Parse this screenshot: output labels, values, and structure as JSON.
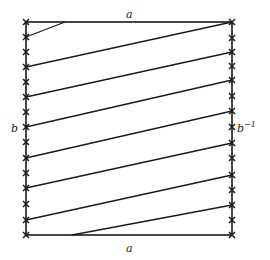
{
  "figure": {
    "labels": {
      "top": "a",
      "bottom": "a",
      "left": "b",
      "right": "b",
      "right_exponent": "−1"
    },
    "square": {
      "x0": 26,
      "y0": 22,
      "x1": 232,
      "y1": 235
    },
    "left_markers_y": [
      22,
      37,
      52,
      67,
      82,
      97,
      112,
      127,
      142,
      158,
      173,
      188,
      204,
      220,
      235
    ],
    "right_markers_y": [
      22,
      38,
      52,
      66,
      80,
      96,
      111,
      127,
      143,
      158,
      175,
      190,
      205,
      220,
      235
    ],
    "lines": [
      {
        "x1": 26,
        "y1": 37,
        "x2": 65,
        "y2": 22
      },
      {
        "x1": 26,
        "y1": 67,
        "x2": 232,
        "y2": 22
      },
      {
        "x1": 26,
        "y1": 97,
        "x2": 232,
        "y2": 52
      },
      {
        "x1": 26,
        "y1": 127,
        "x2": 232,
        "y2": 80
      },
      {
        "x1": 26,
        "y1": 158,
        "x2": 232,
        "y2": 111
      },
      {
        "x1": 26,
        "y1": 188,
        "x2": 232,
        "y2": 143
      },
      {
        "x1": 26,
        "y1": 220,
        "x2": 232,
        "y2": 175
      },
      {
        "x1": 72,
        "y1": 235,
        "x2": 232,
        "y2": 205
      }
    ],
    "colors": {
      "stroke": "#1a1a1a",
      "background": "#ffffff"
    }
  }
}
